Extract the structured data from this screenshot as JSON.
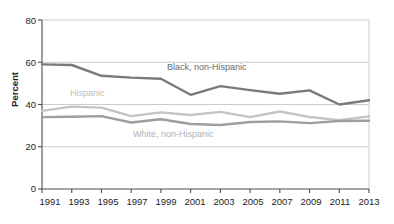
{
  "chart_data": {
    "type": "line",
    "title": "",
    "subtitle": "",
    "xlabel": "",
    "ylabel": "Percent",
    "x": [
      1991,
      1993,
      1995,
      1997,
      1999,
      2001,
      2003,
      2005,
      2007,
      2009,
      2011,
      2013
    ],
    "xticklabels": [
      "1991",
      "1993",
      "1995",
      "1997",
      "1999",
      "2001",
      "2003",
      "2005",
      "2007",
      "2009",
      "2011",
      "2013"
    ],
    "yticklabels": [
      "0",
      "20",
      "40",
      "60",
      "80"
    ],
    "yticks": [
      0,
      20,
      40,
      60,
      80
    ],
    "ylim": [
      0,
      80
    ],
    "xlim": [
      1991,
      2013
    ],
    "grid": "horizontal",
    "legend_position": "inline-annotations",
    "series": [
      {
        "name": "Black, non-Hispanic",
        "color": "#7a7a7a",
        "values": [
          59.0,
          58.7,
          53.6,
          52.7,
          52.2,
          44.6,
          48.7,
          46.8,
          45.1,
          46.7,
          40.0,
          42.0
        ]
      },
      {
        "name": "Hispanic",
        "color": "#c4c4c4",
        "values": [
          37.0,
          39.0,
          38.5,
          34.5,
          36.3,
          35.0,
          36.5,
          34.0,
          36.7,
          34.1,
          32.6,
          34.4
        ]
      },
      {
        "name": "White, non-Hispanic",
        "color": "#9e9e9e",
        "values": [
          34.0,
          34.2,
          34.5,
          31.5,
          33.0,
          30.8,
          30.3,
          31.7,
          32.0,
          31.2,
          32.2,
          32.3
        ]
      }
    ],
    "annotations": [
      {
        "text": "Black, non-Hispanic",
        "color": "#6b6b6b"
      },
      {
        "text": "Hispanic",
        "color": "#bdbdbd"
      },
      {
        "text": "White, non-Hispanic",
        "color": "#b0b0b0"
      }
    ]
  },
  "axes": {
    "y_axis_title": "Percent",
    "y_ticks": [
      {
        "label": "80"
      },
      {
        "label": "60"
      },
      {
        "label": "40"
      },
      {
        "label": "20"
      },
      {
        "label": "0"
      }
    ],
    "x_ticks": [
      {
        "label": "1991"
      },
      {
        "label": "1993"
      },
      {
        "label": "1995"
      },
      {
        "label": "1997"
      },
      {
        "label": "1999"
      },
      {
        "label": "2001"
      },
      {
        "label": "2003"
      },
      {
        "label": "2005"
      },
      {
        "label": "2007"
      },
      {
        "label": "2009"
      },
      {
        "label": "2011"
      },
      {
        "label": "2013"
      }
    ]
  },
  "colors": {
    "background": "#ffffff",
    "axis": "#4d4d4d",
    "grid": "#bfbfbf",
    "text": "#1c1c1c",
    "series_black": "#7a7a7a",
    "series_hispanic": "#c4c4c4",
    "series_white": "#9e9e9e"
  }
}
